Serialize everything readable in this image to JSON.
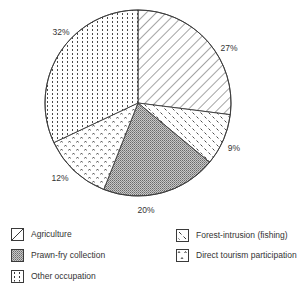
{
  "chart_data": {
    "type": "pie",
    "title": "",
    "start_angle_deg": 0,
    "direction": "clockwise",
    "center": [
      138,
      103
    ],
    "radius": 93,
    "slices": [
      {
        "key": "agriculture",
        "label": "Agriculture",
        "value": 27,
        "display": "27%",
        "pattern": "diagonal-lines",
        "label_pos": [
          229,
          48
        ]
      },
      {
        "key": "forest",
        "label": "Forest-intrusion (fishing)",
        "value": 9,
        "display": "9%",
        "pattern": "diagonal-dashes",
        "label_pos": [
          234,
          148
        ]
      },
      {
        "key": "prawn",
        "label": "Prawn-fry collection",
        "value": 20,
        "display": "20%",
        "pattern": "dense-stipple",
        "label_pos": [
          146,
          210
        ]
      },
      {
        "key": "tourism",
        "label": "Direct tourism participation",
        "value": 12,
        "display": "12%",
        "pattern": "carets",
        "label_pos": [
          60,
          178
        ]
      },
      {
        "key": "other",
        "label": "Other occupation",
        "value": 32,
        "display": "32%",
        "pattern": "vertical-dots",
        "label_pos": [
          61,
          32
        ]
      }
    ],
    "legend_position": "bottom",
    "grid": false
  },
  "legend": {
    "items": [
      {
        "label": "Agriculture",
        "pattern": "diagonal-lines"
      },
      {
        "label": "Prawn-fry collection",
        "pattern": "dense-stipple"
      },
      {
        "label": "Other occupation",
        "pattern": "vertical-dots"
      },
      {
        "label": "Forest-intrusion (fishing)",
        "pattern": "diagonal-dashes"
      },
      {
        "label": "Direct tourism participation",
        "pattern": "carets"
      }
    ]
  },
  "colors": {
    "stroke": "#3a3a3a",
    "pattern_ink": "#4a4a4a",
    "background": "#ffffff"
  }
}
